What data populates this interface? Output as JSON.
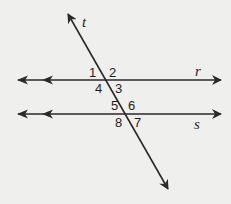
{
  "diagram": {
    "colors": {
      "background": "#efefed",
      "stroke": "#2a2a2a",
      "text": "#1e1e1e"
    },
    "lines": [
      {
        "name": "r",
        "label": "r",
        "type": "parallel-line"
      },
      {
        "name": "s",
        "label": "s",
        "type": "parallel-line"
      },
      {
        "name": "t",
        "label": "t",
        "type": "transversal"
      }
    ],
    "angles": [
      "1",
      "2",
      "3",
      "4",
      "5",
      "6",
      "7",
      "8"
    ]
  }
}
